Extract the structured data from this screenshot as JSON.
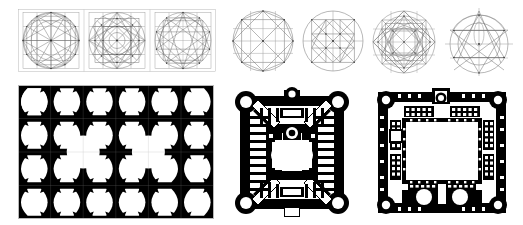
{
  "plate": {
    "title": "Islamic geometric construction and architectural plan analysis plate",
    "background_color": "#ffffff",
    "ink_color": "#000000",
    "line_color": "#5a5a5a",
    "frame_color": "#b4b4b4",
    "width": 523,
    "height": 225
  },
  "figures": [
    {
      "id": "strip-constructions",
      "name": "three-panel geometric construction strip",
      "x": 18,
      "y": 9,
      "w": 198,
      "h": 63,
      "panels": [
        {
          "id": "panel-a",
          "label": "12-fold radial construction in square",
          "divisions": 12,
          "grid": 4
        },
        {
          "id": "panel-b",
          "label": "8-point star rosette construction",
          "divisions": 16,
          "grid": 4
        },
        {
          "id": "panel-c",
          "label": "interlaced decagram construction",
          "divisions": 10,
          "grid": 4
        }
      ]
    },
    {
      "id": "circle-octagon",
      "name": "octagon in circle construction",
      "x": 232,
      "y": 10,
      "w": 62,
      "h": 62,
      "label": "Octagon inscribed in circle with rotated squares"
    },
    {
      "id": "circle-grid",
      "name": "nine-square grid in circle construction",
      "x": 302,
      "y": 10,
      "w": 62,
      "h": 62,
      "label": "Three-by-three grid with diagonals inscribed in circle"
    },
    {
      "id": "circle-rosette",
      "name": "eight-fold rosette construction",
      "x": 372,
      "y": 10,
      "w": 64,
      "h": 64,
      "label": "Interlaced octagram rosette in circle"
    },
    {
      "id": "circle-triangle",
      "name": "triangulated circle construction",
      "x": 444,
      "y": 6,
      "w": 68,
      "h": 70,
      "label": "Equilateral triangle and arc construction in circle"
    },
    {
      "id": "tile-pattern",
      "name": "black and white tile pattern",
      "x": 18,
      "y": 85,
      "w": 196,
      "h": 134,
      "label": "Eight-pointed star and rounded-octagon tiling",
      "cols": 6,
      "rows": 4,
      "star_points": 8,
      "large_medallions": 2
    },
    {
      "id": "plan-central",
      "name": "centralised domed building plan",
      "x": 228,
      "y": 86,
      "w": 128,
      "h": 133,
      "label": "Four-towered centrally planned building with diagonal vestibules",
      "corner_towers": 4
    },
    {
      "id": "plan-courtyard",
      "name": "courtyard building plan",
      "x": 372,
      "y": 86,
      "w": 140,
      "h": 133,
      "label": "Courtyard plan with colonnaded halls and corner towers",
      "corner_towers": 4,
      "courtyards": 1
    }
  ]
}
